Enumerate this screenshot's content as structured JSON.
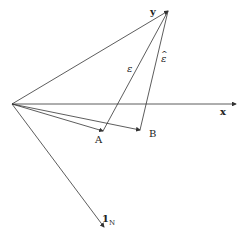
{
  "diagram": {
    "labels": {
      "y": "y",
      "x": "x",
      "epsilon": "ε",
      "epsilon_hat": "ε",
      "epsilon_hat_accent": "^",
      "A": "A",
      "B": "B",
      "ones_main": "1",
      "ones_sub": "N"
    },
    "points": {
      "origin": [
        12,
        104
      ],
      "y": [
        168,
        11
      ],
      "x_tip": [
        236,
        104
      ],
      "A": [
        103,
        131
      ],
      "B": [
        140,
        130
      ],
      "ones_tip": [
        104,
        227
      ]
    },
    "colors": {
      "line": "#333333",
      "text": "#222222",
      "background": "#ffffff"
    }
  }
}
